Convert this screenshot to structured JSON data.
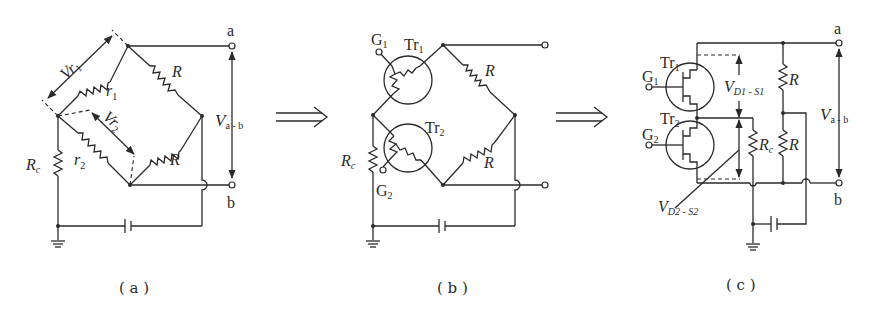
{
  "figure": {
    "panels": [
      {
        "id": "a",
        "caption": "( a )",
        "labels": {
          "terminal_a": "a",
          "terminal_b": "b",
          "v_ab_main": "V",
          "v_ab_sub": "a - b",
          "vr1_main": "Vr",
          "vr1_sub": "1",
          "vr2_main": "Vr",
          "vr2_sub": "2",
          "r1_main": "r",
          "r1_sub": "1",
          "r2_main": "r",
          "r2_sub": "2",
          "R_upper": "R",
          "R_lower": "R",
          "Rc_main": "R",
          "Rc_sub": "c"
        }
      },
      {
        "id": "b",
        "caption": "( b )",
        "labels": {
          "G1_main": "G",
          "G1_sub": "1",
          "G2_main": "G",
          "G2_sub": "2",
          "Tr1_main": "Tr",
          "Tr1_sub": "1",
          "Tr2_main": "Tr",
          "Tr2_sub": "2",
          "R_upper": "R",
          "R_lower": "R",
          "Rc_main": "R",
          "Rc_sub": "c"
        }
      },
      {
        "id": "c",
        "caption": "( c )",
        "labels": {
          "terminal_a": "a",
          "terminal_b": "b",
          "Tr1_main": "Tr",
          "Tr1_sub": "1",
          "Tr2_main": "Tr",
          "Tr2_sub": "2",
          "G1_main": "G",
          "G1_sub": "1",
          "G2_main": "G",
          "G2_sub": "2",
          "vds1_main": "V",
          "vds1_sub": "D1 - S1",
          "vds2_main": "V",
          "vds2_sub": "D2 - S2",
          "Rc_main": "R",
          "Rc_sub": "c",
          "R_upper": "R",
          "R_lower": "R",
          "v_ab_main": "V",
          "v_ab_sub": "a - b"
        }
      }
    ],
    "transition_arrows": [
      "⟹",
      "⟹"
    ],
    "icons": {
      "ground": "ground-symbol",
      "capacitor": "capacitor-symbol",
      "resistor": "zigzag-resistor",
      "transistor": "circle-enclosed-transistor"
    }
  }
}
